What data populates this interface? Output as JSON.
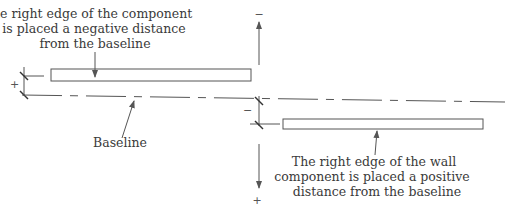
{
  "labels": {
    "top_left": [
      "The right edge of the component",
      "is placed a negative distance",
      "from the baseline"
    ],
    "baseline": "Baseline",
    "bottom_right": [
      "The right edge of the wall",
      "component is placed a positive",
      "distance from the baseline"
    ]
  },
  "signs": {
    "left_plus": "+",
    "mid_minus": "−",
    "top_minus": "−",
    "bottom_plus": "+"
  },
  "colors": {
    "stroke": "#555555",
    "text": "#3a3a3a"
  }
}
